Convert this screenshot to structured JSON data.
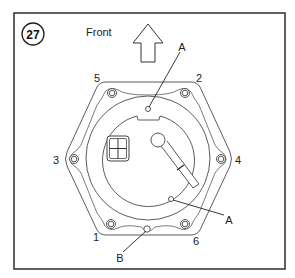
{
  "figure": {
    "number": "27",
    "orientation_label": "Front"
  },
  "callouts": {
    "pin_top": "A",
    "pin_lower": "A",
    "hole_bottom": "B"
  },
  "bolt_sequence": {
    "bolt_1": "1",
    "bolt_2": "2",
    "bolt_3": "3",
    "bolt_4": "4",
    "bolt_5": "5",
    "bolt_6": "6"
  },
  "colors": {
    "line": "#4a4a4a",
    "frame": "#3a3a3a",
    "background": "#ffffff"
  }
}
